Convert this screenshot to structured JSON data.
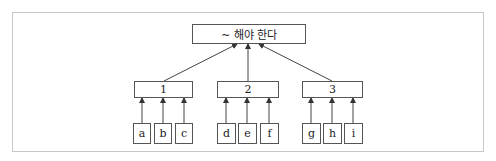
{
  "diagram": {
    "root": {
      "label": "~ 해야 한다"
    },
    "groups": [
      {
        "label": "1",
        "children": [
          "a",
          "b",
          "c"
        ]
      },
      {
        "label": "2",
        "children": [
          "d",
          "e",
          "f"
        ]
      },
      {
        "label": "3",
        "children": [
          "g",
          "h",
          "i"
        ]
      }
    ]
  },
  "colors": {
    "line": "#444444",
    "frame": "#c8c8c8"
  }
}
